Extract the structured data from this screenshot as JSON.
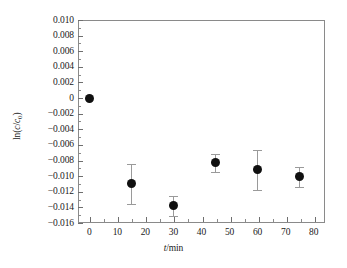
{
  "chart_data": {
    "type": "scatter",
    "title": "",
    "xlabel": "t/min",
    "ylabel": "ln(c/c0)",
    "ylabel_parts": {
      "prefix": "ln(",
      "numerator": "c",
      "slash": "/",
      "denominator": "c",
      "subscript": "0",
      "suffix": ")"
    },
    "xlim": [
      -4,
      84
    ],
    "ylim": [
      -0.016,
      0.01
    ],
    "x_ticks": [
      0,
      10,
      20,
      30,
      40,
      50,
      60,
      70,
      80
    ],
    "x_tick_labels": [
      "0",
      "10",
      "20",
      "30",
      "40",
      "50",
      "60",
      "70",
      "80"
    ],
    "x_minor_step": 5,
    "y_ticks": [
      0.01,
      0.008,
      0.006,
      0.004,
      0.002,
      0.0,
      -0.002,
      -0.004,
      -0.006,
      -0.008,
      -0.01,
      -0.012,
      -0.014,
      -0.016
    ],
    "y_tick_labels": [
      "0.010",
      "0.008",
      "0.006",
      "0.004",
      "0.002",
      "0",
      "−0.002",
      "−0.004",
      "−0.006",
      "−0.008",
      "−0.010",
      "−0.012",
      "−0.014",
      "−0.016"
    ],
    "y_minor_step": 0.001,
    "grid": false,
    "legend": null,
    "marker": "filled-circle",
    "marker_color": "#101010",
    "errorbar_color": "#9a9a9a",
    "axis_color": "#8a8a8a",
    "x": [
      0,
      15,
      30,
      45,
      60,
      75
    ],
    "y": [
      0.0,
      -0.011,
      -0.0138,
      -0.0083,
      -0.0092,
      -0.0101
    ],
    "yerr": [
      0.0,
      0.0026,
      0.0013,
      0.0012,
      0.0026,
      0.0013
    ],
    "points": [
      {
        "x": 0,
        "y": 0.0,
        "yerr": 0.0
      },
      {
        "x": 15,
        "y": -0.011,
        "yerr": 0.0026
      },
      {
        "x": 30,
        "y": -0.0138,
        "yerr": 0.0013
      },
      {
        "x": 45,
        "y": -0.0083,
        "yerr": 0.0012
      },
      {
        "x": 60,
        "y": -0.0092,
        "yerr": 0.0026
      },
      {
        "x": 75,
        "y": -0.0101,
        "yerr": 0.0013
      }
    ]
  }
}
